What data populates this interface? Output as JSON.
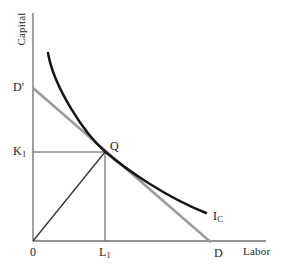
{
  "axes": {
    "y_label": "Capital",
    "x_label": "Labor",
    "origin_label": "0"
  },
  "labels": {
    "d_prime": "D'",
    "k1": {
      "main": "K",
      "sub": "1"
    },
    "q": "Q",
    "l1": {
      "main": "L",
      "sub": "1"
    },
    "d": "D",
    "isoquant": {
      "main": "I",
      "sub": "C"
    }
  },
  "colors": {
    "background": "#ffffff",
    "isoquant_curve": "#161616",
    "isocost_line": "#9c9c9c",
    "axis": "#6e6e6e",
    "construction_line": "#4e4e4e",
    "ray_line": "#333333",
    "text": "#1e1e1e"
  }
}
